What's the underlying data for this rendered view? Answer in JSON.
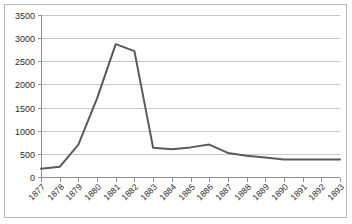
{
  "chart_data": {
    "type": "line",
    "title": "",
    "subtitle": "",
    "xlabel": "",
    "ylabel": "",
    "ylim": [
      0,
      3500
    ],
    "ytick_step": 500,
    "yticks": [
      "0",
      "500",
      "1000",
      "1500",
      "2000",
      "2500",
      "3000",
      "3500"
    ],
    "grid": true,
    "legend": "none",
    "categories": [
      "1877",
      "1878",
      "1879",
      "1880",
      "1881",
      "1882",
      "1883",
      "1884",
      "1885",
      "1886",
      "1887",
      "1888",
      "1889",
      "1890",
      "1891",
      "1892",
      "1893"
    ],
    "values": [
      180,
      220,
      700,
      1700,
      2870,
      2720,
      630,
      600,
      640,
      700,
      520,
      460,
      420,
      380,
      380,
      380,
      380
    ],
    "series": [
      {
        "name": "series-1",
        "color": "#5a5a5a",
        "values": [
          180,
          220,
          700,
          1700,
          2870,
          2720,
          630,
          600,
          640,
          700,
          520,
          460,
          420,
          380,
          380,
          380,
          380
        ]
      }
    ]
  },
  "style": {
    "line_color": "#5a5a5a",
    "grid_color": "#c8c8c8",
    "axis_color": "#8f8f8f",
    "border_color": "#b9b9b9",
    "background": "#ffffff",
    "text_color": "#2b2b2b"
  }
}
